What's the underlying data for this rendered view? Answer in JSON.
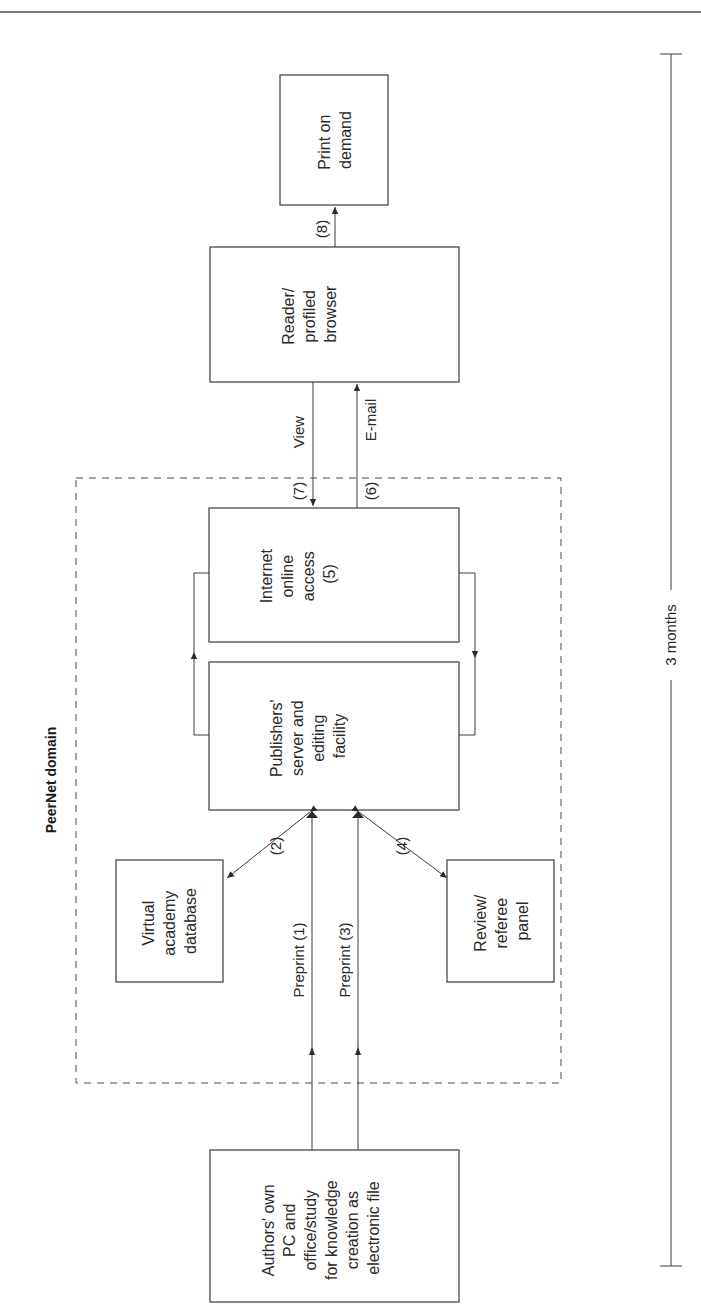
{
  "diagram": {
    "domain_label": "PeerNet domain",
    "duration_label": "3 months",
    "nodes": {
      "authors": {
        "lines": [
          "Authors' own",
          "PC and",
          "office/study",
          "for knowledge",
          "creation as",
          "electronic file"
        ]
      },
      "virtual_academy": {
        "lines": [
          "Virtual",
          "academy",
          "database"
        ]
      },
      "review_panel": {
        "lines": [
          "Review/",
          "referee",
          "panel"
        ]
      },
      "publishers": {
        "lines": [
          "Publishers'",
          "server and",
          "editing",
          "facility"
        ]
      },
      "internet": {
        "lines": [
          "Internet",
          "online",
          "access",
          "(5)"
        ]
      },
      "reader": {
        "lines": [
          "Reader/",
          "profiled",
          "browser"
        ]
      },
      "print": {
        "lines": [
          "Print on",
          "demand"
        ]
      }
    },
    "edges": {
      "preprint1": "Preprint (1)",
      "preprint3": "Preprint (3)",
      "step2": "(2)",
      "step4": "(4)",
      "step6": "(6)",
      "step7": "(7)",
      "step8": "(8)",
      "view": "View",
      "email": "E-mail"
    }
  }
}
